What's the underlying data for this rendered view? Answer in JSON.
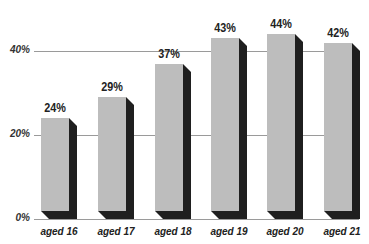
{
  "chart_data": {
    "type": "bar",
    "title": "",
    "xlabel": "",
    "ylabel": "",
    "categories": [
      "aged 16",
      "aged 17",
      "aged 18",
      "aged 19",
      "aged 20",
      "aged 21"
    ],
    "values": [
      24,
      29,
      37,
      43,
      44,
      42
    ],
    "value_labels": [
      "24%",
      "29%",
      "37%",
      "43%",
      "44%",
      "42%"
    ],
    "ylim": [
      0,
      50
    ],
    "yticks": [
      0,
      20,
      40
    ],
    "ytick_labels": [
      "0%",
      "20%",
      "40%"
    ],
    "grid": true,
    "legend": null,
    "style": "3d-shadow",
    "colors": {
      "bar_face": "#bdbdbd",
      "bar_shadow": "#1f1f1f",
      "gridline": "#9a9a9a"
    }
  }
}
